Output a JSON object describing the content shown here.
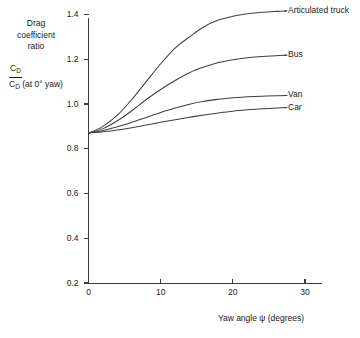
{
  "chart_data": {
    "type": "line",
    "title": "",
    "xlabel": "Yaw angle ψ (degrees)",
    "ylabel_words": "Drag\ncoefficient\nratio",
    "ylabel_fraction_numerator": "C",
    "ylabel_fraction_numerator_sub": "D",
    "ylabel_fraction_denominator": "C",
    "ylabel_fraction_denominator_sub": "D",
    "ylabel_fraction_denominator_rest": " (at 0° yaw)",
    "xlim": [
      0,
      32
    ],
    "ylim": [
      0,
      1.48
    ],
    "grid": false,
    "legend_position": "right-inline-labels",
    "xticks": [
      0,
      10,
      20,
      30
    ],
    "xtick_labels": [
      "0",
      "10",
      "20",
      "30"
    ],
    "yticks": [
      0.2,
      0.4,
      0.6,
      0.8,
      1.0,
      1.2,
      1.4
    ],
    "ytick_labels": [
      "0.2",
      "0.4",
      "0.6",
      "0.8",
      "1.0",
      "1.2",
      "1.4"
    ],
    "x": [
      0,
      2,
      4,
      6,
      8,
      10,
      12,
      14,
      16,
      18,
      20,
      22,
      24,
      26,
      27.5
    ],
    "series": [
      {
        "name": "Articulated truck",
        "label": "Articulated truck",
        "values": [
          0.87,
          0.9,
          0.95,
          1.02,
          1.1,
          1.18,
          1.25,
          1.3,
          1.345,
          1.375,
          1.392,
          1.403,
          1.41,
          1.414,
          1.416
        ]
      },
      {
        "name": "Bus",
        "label": "Bus",
        "values": [
          0.87,
          0.89,
          0.925,
          0.97,
          1.02,
          1.065,
          1.105,
          1.14,
          1.165,
          1.185,
          1.198,
          1.207,
          1.212,
          1.216,
          1.218
        ]
      },
      {
        "name": "Van",
        "label": "Van",
        "values": [
          0.87,
          0.882,
          0.898,
          0.918,
          0.94,
          0.962,
          0.982,
          0.999,
          1.012,
          1.021,
          1.028,
          1.032,
          1.035,
          1.037,
          1.038
        ]
      },
      {
        "name": "Car",
        "label": "Car",
        "values": [
          0.87,
          0.876,
          0.884,
          0.894,
          0.906,
          0.918,
          0.93,
          0.941,
          0.951,
          0.96,
          0.968,
          0.974,
          0.979,
          0.982,
          0.984
        ]
      }
    ]
  },
  "colors": {
    "axis": "#3b3b3b",
    "curve": "#3f3f3f",
    "text": "#1a1a1a",
    "background": "#ffffff"
  }
}
